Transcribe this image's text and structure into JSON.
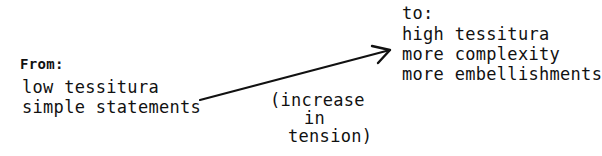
{
  "from_block": {
    "heading": "From:",
    "lines": [
      "low tessitura",
      "simple statements"
    ]
  },
  "to_block": {
    "heading": "to:",
    "lines": [
      "high tessitura",
      "more complexity",
      "more embellishments"
    ]
  },
  "arrow_annotation": {
    "lines": [
      "(increase",
      "in",
      "tension)"
    ]
  },
  "arrow": {
    "from": [
      200,
      100
    ],
    "to": [
      390,
      50
    ],
    "color": "#111111"
  }
}
